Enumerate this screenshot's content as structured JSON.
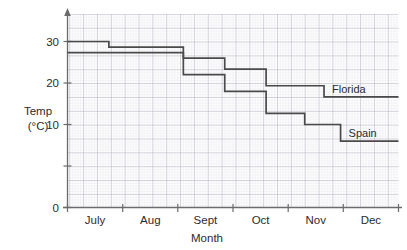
{
  "chart_data": {
    "type": "line",
    "subtype": "step",
    "title": "",
    "xlabel": "Month",
    "ylabel": "Temp (°C)",
    "ylabel_lines": [
      "Temp",
      "(°C)"
    ],
    "categories": [
      "July",
      "Aug",
      "Sept",
      "Oct",
      "Nov",
      "Dec"
    ],
    "x_tick_labels": [
      "July",
      "Aug",
      "Sept",
      "Oct",
      "Nov",
      "Dec"
    ],
    "y_tick_labels": [
      "0",
      "10",
      "20",
      "30"
    ],
    "y_tick_values": [
      0,
      10,
      20,
      30
    ],
    "ylim": [
      0,
      32
    ],
    "xlim": [
      0,
      6
    ],
    "grid": "both",
    "grid_minor_per_major": 5,
    "legend_position": "inline-right",
    "series": [
      {
        "name": "Florida",
        "label": "Florida",
        "color": "#4a4a4a",
        "steps": [
          {
            "x_start": 0.0,
            "x_end": 0.75,
            "value": 30
          },
          {
            "x_start": 0.75,
            "x_end": 2.1,
            "value": 29
          },
          {
            "x_start": 2.1,
            "x_end": 2.85,
            "value": 27
          },
          {
            "x_start": 2.85,
            "x_end": 3.6,
            "value": 25
          },
          {
            "x_start": 3.6,
            "x_end": 4.65,
            "value": 22
          },
          {
            "x_start": 4.65,
            "x_end": 6.0,
            "value": 20
          }
        ],
        "final_value": 20
      },
      {
        "name": "Spain",
        "label": "Spain",
        "color": "#4a4a4a",
        "steps": [
          {
            "x_start": 0.0,
            "x_end": 2.1,
            "value": 28
          },
          {
            "x_start": 2.1,
            "x_end": 2.85,
            "value": 24
          },
          {
            "x_start": 2.85,
            "x_end": 3.6,
            "value": 21
          },
          {
            "x_start": 3.6,
            "x_end": 4.3,
            "value": 17
          },
          {
            "x_start": 4.3,
            "x_end": 4.95,
            "value": 15
          },
          {
            "x_start": 4.95,
            "x_end": 6.0,
            "value": 12
          }
        ],
        "final_value": 12
      }
    ],
    "colors": {
      "line": "#4a4a4a",
      "axis": "#6b6b6b",
      "grid_major": "#a8a8b4",
      "grid_minor": "#d8d8e0",
      "text": "#2b2b2b",
      "background": "#ffffff"
    }
  }
}
